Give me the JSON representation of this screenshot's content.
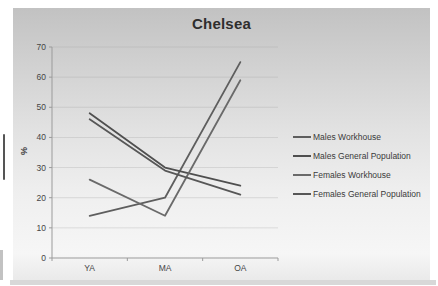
{
  "chart_data": {
    "type": "line",
    "title": "Chelsea",
    "xlabel": "",
    "ylabel": "%",
    "categories": [
      "YA",
      "MA",
      "OA"
    ],
    "yticks": [
      0,
      10,
      20,
      30,
      40,
      50,
      60,
      70
    ],
    "ylim": [
      0,
      70
    ],
    "grid": true,
    "legend_position": "right",
    "series": [
      {
        "name": "Males Workhouse",
        "values": [
          14,
          20,
          65
        ],
        "color": "#5e5e5e"
      },
      {
        "name": "Males General Population",
        "values": [
          48,
          30,
          24
        ],
        "color": "#4f4f4f"
      },
      {
        "name": "Females Workhouse",
        "values": [
          26,
          14,
          59
        ],
        "color": "#6a6a6a"
      },
      {
        "name": "Females General Population",
        "values": [
          46,
          29,
          21
        ],
        "color": "#575757"
      }
    ]
  },
  "style_colors": {
    "axis": "#9b9b9b",
    "gridline": "#a8a8a8",
    "tick_text": "#454545"
  }
}
